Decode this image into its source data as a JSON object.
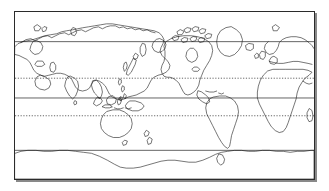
{
  "figure": {
    "kind": "world-map",
    "title": "",
    "projection": "equirectangular-pacific-centered",
    "background_color": "#ffffff",
    "frame": {
      "border_color": "#2b2b2b",
      "border_width_px": 1,
      "shadow_color": "#555555",
      "x": 14,
      "y": 11,
      "width": 301,
      "height": 169
    },
    "coastline": {
      "stroke_color": "#1a1a1a",
      "stroke_width_px": 0.6,
      "fill": "none"
    }
  },
  "chart_data": {
    "type": "map",
    "title": "",
    "xlabel": "",
    "ylabel": "",
    "lon_range": [
      20,
      380
    ],
    "lat_range": [
      -90,
      90
    ],
    "grid": false,
    "graticule": [
      {
        "name": "Arctic Circle",
        "latitude": 66.5,
        "style": "solid",
        "color": "#222222",
        "y_px": 42
      },
      {
        "name": "Tropic of Cancer",
        "latitude": 23.5,
        "style": "dotted",
        "color": "#222222",
        "y_px": 79
      },
      {
        "name": "Equator",
        "latitude": 0,
        "style": "solid",
        "color": "#222222",
        "y_px": 99
      },
      {
        "name": "Tropic of Capricorn",
        "latitude": -23.5,
        "style": "dotted",
        "color": "#222222",
        "y_px": 117
      },
      {
        "name": "Antarctic Circle",
        "latitude": -66.5,
        "style": "solid",
        "color": "#222222",
        "y_px": 152
      }
    ],
    "landmasses": [
      "Eurasia",
      "Africa",
      "Arabian Peninsula",
      "India",
      "Southeast Asia",
      "Japan",
      "Korean Peninsula",
      "Indonesia",
      "Philippines",
      "New Guinea",
      "Australia",
      "New Zealand",
      "Antarctica",
      "North America",
      "Canadian Arctic Archipelago",
      "Greenland",
      "Iceland",
      "British Isles",
      "Central America",
      "Caribbean",
      "South America",
      "Madagascar",
      "Sri Lanka",
      "Svalbard",
      "Novaya Zemlya",
      "Taiwan",
      "Tasmania",
      "Antarctic Peninsula"
    ],
    "labels": [],
    "legend": []
  }
}
